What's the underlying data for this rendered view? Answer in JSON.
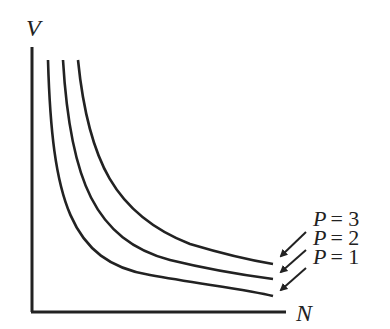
{
  "diagram": {
    "type": "isobar-curves",
    "y_axis_label": "V",
    "x_axis_label": "N",
    "curves": [
      {
        "label_var": "P",
        "label_eq": "= 3",
        "value": 3
      },
      {
        "label_var": "P",
        "label_eq": "= 2",
        "value": 2
      },
      {
        "label_var": "P",
        "label_eq": "= 1",
        "value": 1
      }
    ],
    "color": "#222222"
  }
}
